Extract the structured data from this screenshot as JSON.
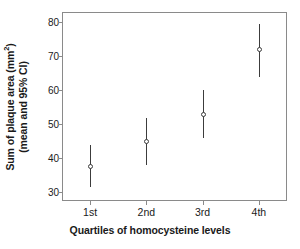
{
  "chart_data": {
    "type": "scatter",
    "title": "",
    "xlabel": "Quartiles of homocysteine levels",
    "ylabel_line1": "Sum of plaque area (mm",
    "ylabel_line1_sup": "2",
    "ylabel_line1_end": ")",
    "ylabel_line2": "(mean and 95% CI)",
    "ylabel_full": "Sum of plaque area (mm2) (mean and 95% CI)",
    "categories": [
      "1st",
      "2nd",
      "3rd",
      "4th"
    ],
    "values": [
      37.5,
      45.0,
      53.0,
      72.0
    ],
    "ci_lower": [
      31.5,
      38.0,
      46.0,
      64.0
    ],
    "ci_upper": [
      44.0,
      52.0,
      60.0,
      79.5
    ],
    "ylim": [
      27.5,
      83.0
    ],
    "yticks": [
      30,
      40,
      50,
      60,
      70,
      80
    ],
    "ytick_labels": [
      "30",
      "40",
      "50",
      "60",
      "70",
      "80"
    ],
    "grid": false,
    "legend": null,
    "marker_style": "open-circle",
    "errorbar_color": "#3c3c3c",
    "frame_color": "#8a8a8a",
    "background_color": "#ffffff"
  }
}
